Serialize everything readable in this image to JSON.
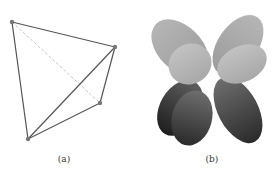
{
  "figure": {
    "subfigures": [
      {
        "caption": "(a)",
        "description": "Tetrahedron wireframe with four vertices, one hidden edge dashed"
      },
      {
        "caption": "(b)",
        "description": "Shaded 3D four-lobed (clover-like) surface in grayscale"
      }
    ]
  },
  "colors": {
    "edge": "#555555",
    "dashed": "#bbbbbb",
    "vertex": "#777777"
  }
}
